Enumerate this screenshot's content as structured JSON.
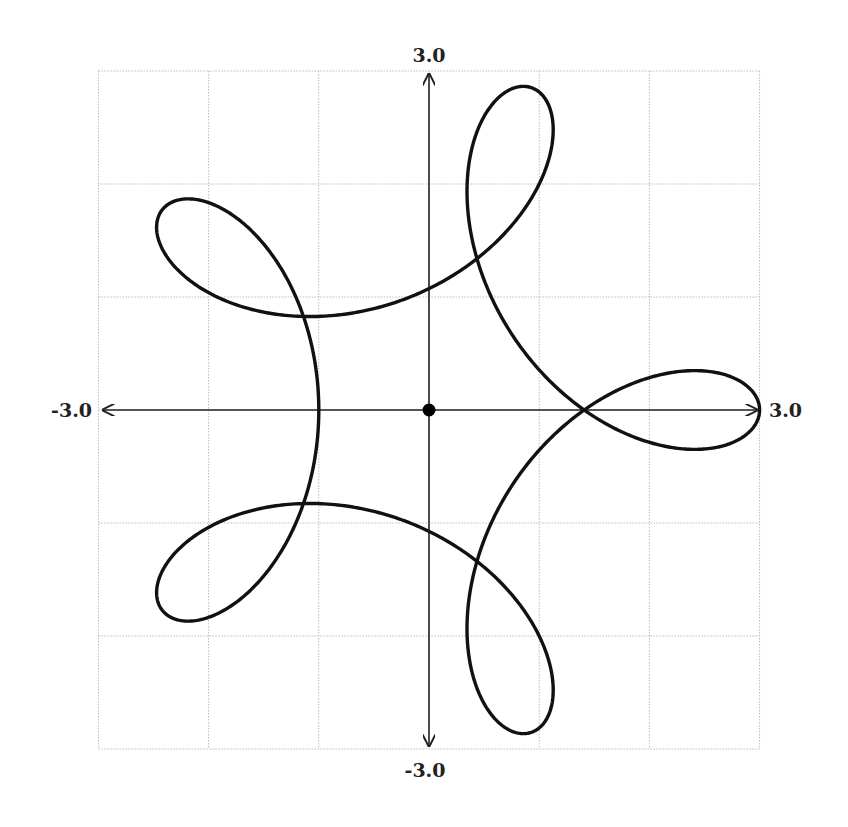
{
  "chart_data": {
    "type": "line",
    "title": "",
    "curve": {
      "name": "hypotrochoid with 5 loops",
      "parametric_x": "2*cos(t) + cos(4*t)",
      "parametric_y": "2*sin(t) - sin(4*t)",
      "t_range": [
        0,
        6.283185
      ],
      "color": "#111111"
    },
    "origin_marker": {
      "x": 0,
      "y": 0
    },
    "xlim": [
      -3.0,
      3.0
    ],
    "ylim": [
      -3.0,
      3.0
    ],
    "grid": true,
    "grid_step": 1,
    "xlabel": "",
    "ylabel": ""
  },
  "labels": {
    "y_max": "3.0",
    "y_min": "-3.0",
    "x_min": "-3.0",
    "x_max": "3.0"
  },
  "colors": {
    "grid": "#bbbbbb",
    "axis": "#222222",
    "curve": "#111111"
  }
}
